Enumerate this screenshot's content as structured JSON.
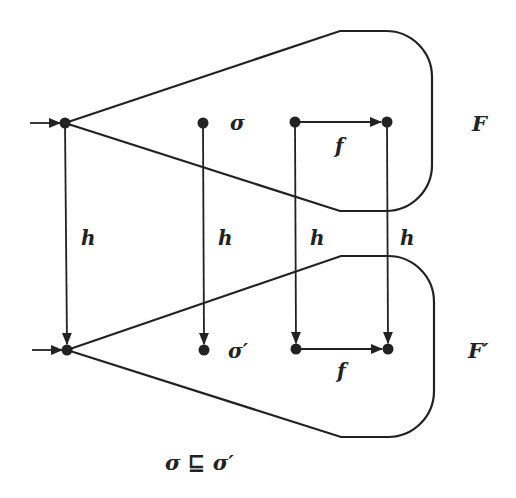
{
  "diagram": {
    "type": "commutative-automaton-homomorphism",
    "top_automaton": {
      "label": "F",
      "state_label": "σ",
      "transition_label": "f"
    },
    "bottom_automaton": {
      "label": "F′",
      "state_label": "σ′",
      "transition_label": "f"
    },
    "mapping_labels": [
      "h",
      "h",
      "h",
      "h"
    ],
    "caption": "σ ⊑ σ′",
    "colors": {
      "ink": "#222222",
      "background": "#ffffff"
    }
  }
}
